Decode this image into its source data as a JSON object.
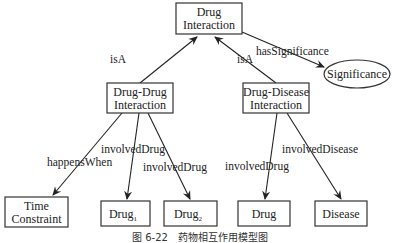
{
  "diagram": {
    "nodes": {
      "drug_interaction": {
        "line1": "Drug",
        "line2": "Interaction"
      },
      "drug_drug_interaction": {
        "line1": "Drug-Drug",
        "line2": "Interaction"
      },
      "drug_disease_interaction": {
        "line1": "Drug-Disease",
        "line2": "Interaction"
      },
      "significance": {
        "label": "Significance"
      },
      "time_constraint": {
        "line1": "Time",
        "line2": "Constraint"
      },
      "drug1": {
        "label": "Drug",
        "subscript": "1"
      },
      "drug2": {
        "label": "Drug",
        "subscript": "2"
      },
      "drug": {
        "label": "Drug"
      },
      "disease": {
        "label": "Disease"
      }
    },
    "edges": {
      "isA_left": "isA",
      "isA_right": "isA",
      "has_significance": "hasSignificance",
      "happens_when": "happensWhen",
      "involved_drug_1": "involvedDrug",
      "involved_drug_2": "involvedDrug",
      "involved_drug_3": "involvedDrug",
      "involved_disease": "involvedDisease"
    },
    "caption": "图 6-22　药物相互作用模型图"
  }
}
